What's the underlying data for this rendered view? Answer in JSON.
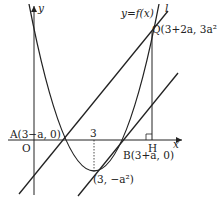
{
  "diagram": {
    "axes": {
      "x_label": "x",
      "y_label": "y",
      "origin_label": "O"
    },
    "curve_label": "y=f(x)",
    "line_label": "l",
    "points": {
      "A": "A(3−a, 0)",
      "B": "B(3+a, 0)",
      "Q": "Q(3+2a, 3a²)",
      "H": "H",
      "vertex": "(3, −a²)"
    },
    "ticks": {
      "x_tick_3": "3"
    },
    "colors": {
      "stroke": "#222222",
      "background": "#ffffff"
    }
  }
}
